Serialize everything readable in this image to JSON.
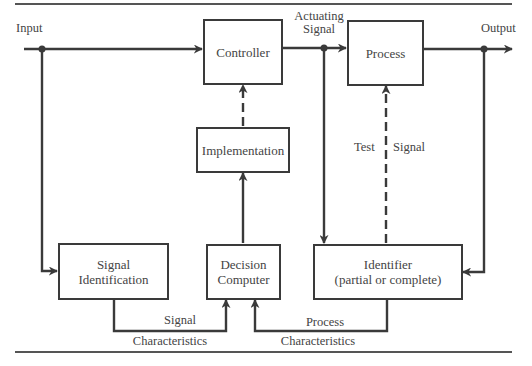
{
  "diagram": {
    "type": "adaptive control block diagram",
    "blocks": {
      "controller": {
        "label": "Controller"
      },
      "process": {
        "label": "Process"
      },
      "implementation": {
        "label": "Implementation"
      },
      "signal_identification": {
        "line1": "Signal",
        "line2": "Identification"
      },
      "decision_computer": {
        "line1": "Decision",
        "line2": "Computer"
      },
      "identifier": {
        "line1": "Identifier",
        "line2": "(partial or complete)"
      }
    },
    "labels": {
      "input": "Input",
      "output": "Output",
      "actuating_signal_line1": "Actuating",
      "actuating_signal_line2": "Signal",
      "test": "Test",
      "signal": "Signal",
      "signal_characteristics_top": "Signal",
      "signal_characteristics_bottom": "Characteristics",
      "process_characteristics_top": "Process",
      "process_characteristics_bottom": "Characteristics"
    },
    "connections": [
      {
        "from": "Input",
        "to": "Controller",
        "style": "solid"
      },
      {
        "from": "Input",
        "to": "Signal Identification",
        "style": "solid"
      },
      {
        "from": "Controller",
        "to": "Process",
        "label": "Actuating Signal",
        "style": "solid"
      },
      {
        "from": "Actuating Signal",
        "to": "Identifier",
        "style": "solid"
      },
      {
        "from": "Process",
        "to": "Output",
        "style": "solid"
      },
      {
        "from": "Output",
        "to": "Identifier",
        "style": "solid"
      },
      {
        "from": "Identifier",
        "to": "Process",
        "label": "Test Signal",
        "style": "dashed"
      },
      {
        "from": "Signal Identification",
        "to": "Decision Computer",
        "label": "Signal Characteristics",
        "style": "solid"
      },
      {
        "from": "Identifier",
        "to": "Decision Computer",
        "label": "Process Characteristics",
        "style": "solid"
      },
      {
        "from": "Decision Computer",
        "to": "Implementation",
        "style": "solid"
      },
      {
        "from": "Implementation",
        "to": "Controller",
        "style": "dashed"
      }
    ],
    "colors": {
      "line": "#3a3a3a",
      "text": "#444444",
      "background": "#ffffff"
    }
  }
}
